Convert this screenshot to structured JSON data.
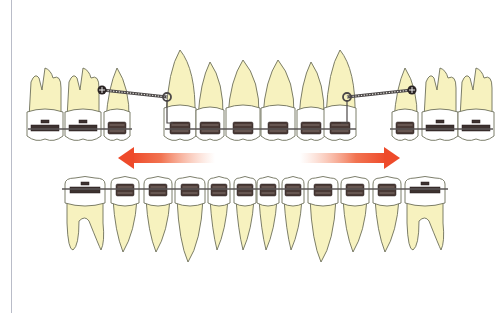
{
  "figure": {
    "title": "Orthodontic space closure with sliding mechanics",
    "colors": {
      "background": "#ffffff",
      "root": "#f7f2bf",
      "crown": "#ffffff",
      "outline": "#6d6f5a",
      "bracket": "#4a3a36",
      "wire": "#5a5656",
      "spring": "#4c4848",
      "arrow": "#ee4a2a",
      "margin_line": "#b9bcc8"
    }
  },
  "upper_arch": {
    "label": "Upper arch",
    "left_segment": [
      {
        "type": "molar",
        "name": "upper-left-second-molar",
        "cx": 45
      },
      {
        "type": "molar",
        "name": "upper-left-first-molar",
        "cx": 83
      },
      {
        "type": "premolar",
        "name": "upper-left-premolar",
        "cx": 117
      }
    ],
    "anterior_segment": [
      {
        "type": "canine",
        "name": "upper-left-canine",
        "cx": 180
      },
      {
        "type": "lateral",
        "name": "upper-left-lateral-incisor",
        "cx": 210
      },
      {
        "type": "central",
        "name": "upper-left-central-incisor",
        "cx": 243
      },
      {
        "type": "central",
        "name": "upper-right-central-incisor",
        "cx": 278
      },
      {
        "type": "lateral",
        "name": "upper-right-lateral-incisor",
        "cx": 311
      },
      {
        "type": "canine",
        "name": "upper-right-canine",
        "cx": 340
      }
    ],
    "right_segment": [
      {
        "type": "premolar",
        "name": "upper-right-premolar",
        "cx": 405
      },
      {
        "type": "molar",
        "name": "upper-right-first-molar",
        "cx": 440
      },
      {
        "type": "molar",
        "name": "upper-right-second-molar",
        "cx": 476
      }
    ],
    "springs": [
      {
        "side": "left",
        "from": [
          102,
          90
        ],
        "to": [
          167,
          97
        ]
      },
      {
        "side": "right",
        "from": [
          347,
          97
        ],
        "to": [
          412,
          90
        ]
      }
    ]
  },
  "lower_arch": {
    "label": "Lower arch",
    "teeth": [
      {
        "type": "molar",
        "cx": 85
      },
      {
        "type": "premolar",
        "cx": 125
      },
      {
        "type": "premolar",
        "cx": 158
      },
      {
        "type": "canine",
        "cx": 190
      },
      {
        "type": "incisor",
        "cx": 219
      },
      {
        "type": "incisor",
        "cx": 245
      },
      {
        "type": "incisor",
        "cx": 268
      },
      {
        "type": "incisor",
        "cx": 293
      },
      {
        "type": "canine",
        "cx": 323
      },
      {
        "type": "premolar",
        "cx": 355
      },
      {
        "type": "premolar",
        "cx": 387
      },
      {
        "type": "molar",
        "cx": 425
      }
    ]
  },
  "arrows": [
    {
      "name": "left-movement-arrow",
      "direction": "left",
      "x1": 215,
      "x2": 118,
      "y": 158
    },
    {
      "name": "right-movement-arrow",
      "direction": "right",
      "x1": 300,
      "x2": 400,
      "y": 158
    }
  ]
}
